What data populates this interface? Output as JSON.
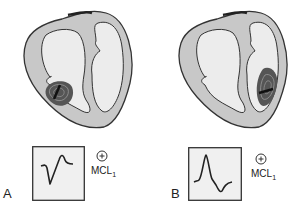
{
  "figure": {
    "panels": [
      {
        "letter": "A",
        "lead": "MCL",
        "lead_sub": "1",
        "electrode_polarity": "+",
        "origin": "left ventricle",
        "waveform": "predominantly negative (QS / rS) complex"
      },
      {
        "letter": "B",
        "lead": "MCL",
        "lead_sub": "1",
        "electrode_polarity": "+",
        "origin": "right ventricle",
        "waveform": "predominantly positive (R) complex"
      }
    ]
  },
  "colors": {
    "heart_fill": "#c8c8c8",
    "chamber_fill": "#ececec",
    "outline": "#333333",
    "ecg_box_fill": "#f0f0f0",
    "focus_dark": "#333333"
  }
}
